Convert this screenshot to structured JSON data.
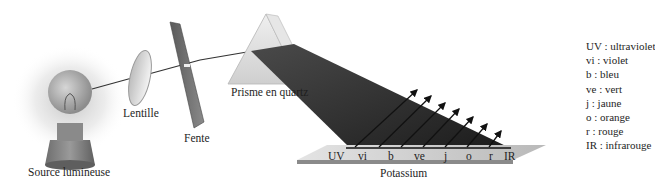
{
  "diagram": {
    "components": {
      "source": "Source lumineuse",
      "lens": "Lentille",
      "slit": "Fente",
      "prism": "Prisme en quartz",
      "target": "Potassium"
    },
    "spectrum_bands": [
      "UV",
      "vi",
      "b",
      "ve",
      "j",
      "o",
      "r",
      "IR"
    ],
    "legend": [
      {
        "abbr": "UV",
        "text": "UV : ultraviolet"
      },
      {
        "abbr": "vi",
        "text": "vi : violet"
      },
      {
        "abbr": "b",
        "text": "b : bleu"
      },
      {
        "abbr": "ve",
        "text": "ve : vert"
      },
      {
        "abbr": "j",
        "text": "j : jaune"
      },
      {
        "abbr": "o",
        "text": "o : orange"
      },
      {
        "abbr": "r",
        "text": "r : rouge"
      },
      {
        "abbr": "IR",
        "text": "IR : infrarouge"
      }
    ],
    "emitted_electron_arrows": 7,
    "colors": {
      "beam": "#2a2a2a",
      "plate_top": "#cfcfcf",
      "plate_side": "#8a8a8a",
      "prism": "#d8d8d8"
    }
  }
}
